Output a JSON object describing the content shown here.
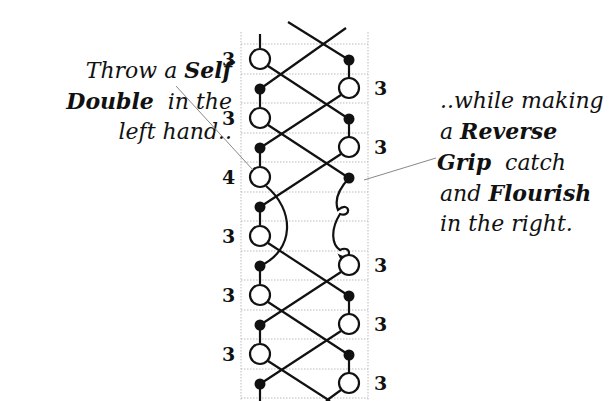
{
  "diagram": {
    "title_cut_off": true,
    "left_caption": {
      "line1_normal": "Throw a ",
      "line1_bold": "Self",
      "line2_bold": "Double",
      "line2_normal": "  in the",
      "line3_normal": "left hand.."
    },
    "right_caption": {
      "line1_normal": "..while making",
      "line2_normal": "a ",
      "line2_bold": "Reverse",
      "line3_bold": "Grip",
      "line3_normal": "  catch",
      "line4_normal": "and ",
      "line4_bold": "Flourish",
      "line5_normal": "in the right."
    },
    "left_throw_numbers": [
      "3",
      "3",
      "4",
      "3",
      "3",
      "3"
    ],
    "right_throw_numbers": [
      "3",
      "3",
      "3",
      "3",
      "3"
    ],
    "colors": {
      "ink": "#111111",
      "grid": "#bbbbbb",
      "background": "#ffffff"
    }
  }
}
